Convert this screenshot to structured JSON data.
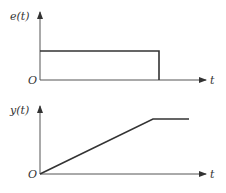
{
  "plots": [
    {
      "id": "input",
      "ylabel": "e(t)",
      "xlabel": "t",
      "origin_label": "O",
      "shape": "rectangular-pulse"
    },
    {
      "id": "output",
      "ylabel": "y(t)",
      "xlabel": "t",
      "origin_label": "O",
      "shape": "ramp-then-hold"
    }
  ],
  "colors": {
    "axis": "#555555",
    "signal": "#333333",
    "background": "#ffffff"
  }
}
